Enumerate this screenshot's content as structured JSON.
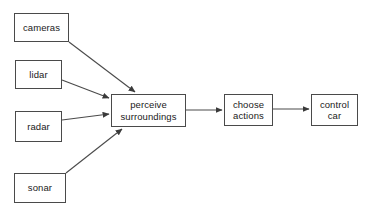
{
  "diagram": {
    "background_color": "#ffffff",
    "line_color": "#4a4a4a",
    "text_color": "#1a1a1a",
    "nodes": [
      {
        "id": "cameras",
        "label": "cameras",
        "x": 14,
        "y": 13,
        "w": 55,
        "h": 29
      },
      {
        "id": "lidar",
        "label": "lidar",
        "x": 15,
        "y": 60,
        "w": 47,
        "h": 29
      },
      {
        "id": "radar",
        "label": "radar",
        "x": 15,
        "y": 111,
        "w": 47,
        "h": 31
      },
      {
        "id": "sonar",
        "label": "sonar",
        "x": 14,
        "y": 173,
        "w": 52,
        "h": 30
      },
      {
        "id": "perceive",
        "label": "perceive\nsurroundings",
        "x": 111,
        "y": 94,
        "w": 75,
        "h": 33
      },
      {
        "id": "choose",
        "label": "choose\nactions",
        "x": 224,
        "y": 94,
        "w": 49,
        "h": 32
      },
      {
        "id": "control",
        "label": "control\ncar",
        "x": 311,
        "y": 94,
        "w": 47,
        "h": 32
      }
    ],
    "edges": [
      {
        "id": "cameras-to-perceive",
        "from": "cameras",
        "to": "perceive",
        "x1": 69,
        "y1": 42,
        "x2": 135,
        "y2": 92
      },
      {
        "id": "lidar-to-perceive",
        "from": "lidar",
        "to": "perceive",
        "x1": 62,
        "y1": 80,
        "x2": 109,
        "y2": 98
      },
      {
        "id": "radar-to-perceive",
        "from": "radar",
        "to": "perceive",
        "x1": 62,
        "y1": 120,
        "x2": 109,
        "y2": 114
      },
      {
        "id": "sonar-to-perceive",
        "from": "sonar",
        "to": "perceive",
        "x1": 66,
        "y1": 173,
        "x2": 122,
        "y2": 129
      },
      {
        "id": "perceive-to-choose",
        "from": "perceive",
        "to": "choose",
        "x1": 186,
        "y1": 110,
        "x2": 222,
        "y2": 110
      },
      {
        "id": "choose-to-control",
        "from": "choose",
        "to": "control",
        "x1": 273,
        "y1": 109,
        "x2": 309,
        "y2": 109
      }
    ]
  }
}
